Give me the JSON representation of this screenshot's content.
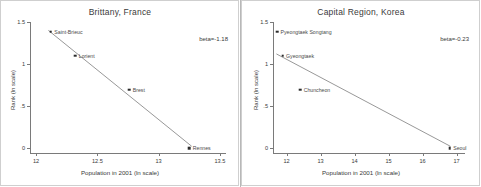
{
  "figure": {
    "background": "#ffffff",
    "point_color": "#2b2b2b",
    "line_color": "#6b6b6b",
    "axis_color": "#7a7a7a"
  },
  "chart_data": [
    {
      "type": "scatter",
      "title": "Brittany, France",
      "xlabel": "Population in 2001 (ln scale)",
      "ylabel": "Rank (ln scale)",
      "annotation": "beta=-1.18",
      "beta": -1.18,
      "xlim": [
        11.95,
        13.55
      ],
      "ylim": [
        -0.06,
        1.5
      ],
      "xticks": [
        "12",
        "12.5",
        "13",
        "13.5"
      ],
      "xtick_values": [
        12,
        12.5,
        13,
        13.5
      ],
      "yticks": [
        "1.5",
        "1",
        ".5",
        "0"
      ],
      "ytick_values": [
        1.5,
        1,
        0.5,
        0
      ],
      "grid": false,
      "legend": "none",
      "points": [
        {
          "label": "Saint-Brieuc",
          "x": 12.12,
          "y": 1.386
        },
        {
          "label": "Lorient",
          "x": 12.32,
          "y": 1.099
        },
        {
          "label": "Brest",
          "x": 12.76,
          "y": 0.693
        },
        {
          "label": "Rennes",
          "x": 13.25,
          "y": 0.0
        }
      ],
      "fit_line": {
        "x1": 12.1,
        "y1": 1.4,
        "x2": 13.27,
        "y2": 0.02
      }
    },
    {
      "type": "scatter",
      "title": "Capital Region, Korea",
      "xlabel": "Population in 2001 (ln scale)",
      "ylabel": "Rank (ln scale)",
      "annotation": "beta=-0.23",
      "beta": -0.23,
      "xlim": [
        11.6,
        17.25
      ],
      "ylim": [
        -0.06,
        1.5
      ],
      "xticks": [
        "12",
        "13",
        "14",
        "15",
        "16",
        "17"
      ],
      "xtick_values": [
        12,
        13,
        14,
        15,
        16,
        17
      ],
      "yticks": [
        "1.5",
        "1",
        ".5",
        "0"
      ],
      "ytick_values": [
        1.5,
        1,
        0.5,
        0
      ],
      "grid": false,
      "legend": "none",
      "points": [
        {
          "label": "Pyeongtaek Songtang",
          "x": 11.72,
          "y": 1.386
        },
        {
          "label": "Gyeongtaek",
          "x": 11.88,
          "y": 1.099
        },
        {
          "label": "Chuncheon",
          "x": 12.4,
          "y": 0.693
        },
        {
          "label": "Seoul",
          "x": 16.8,
          "y": 0.0
        }
      ],
      "fit_line": {
        "x1": 11.7,
        "y1": 1.12,
        "x2": 16.82,
        "y2": 0.02
      }
    }
  ]
}
